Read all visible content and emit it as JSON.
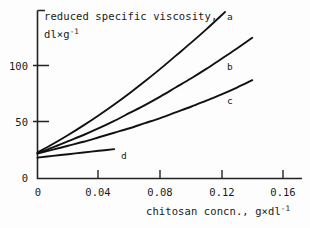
{
  "chart_data": {
    "type": "line",
    "title": "",
    "ylabel": "reduced specific viscosity, dl×g⁻¹",
    "ylabel_line1": "reduced specific viscosity,",
    "ylabel_line2_base": "dl×g",
    "ylabel_line2_sup": "-1",
    "xlabel": "chitosan concn., g×dl⁻¹",
    "xlabel_base1": "chitosan concn., g×dl",
    "xlabel_sup": "-1",
    "xlim": [
      0,
      0.168
    ],
    "ylim": [
      0,
      128
    ],
    "grid": false,
    "legend_position": "inline-right-of-curve",
    "xticks": [
      0,
      0.04,
      0.08,
      0.12,
      0.16
    ],
    "xtick_labels": [
      "0",
      "0.04",
      "0.08",
      "0.12",
      "0.16"
    ],
    "yticks": [
      0,
      50,
      100
    ],
    "ytick_labels": [
      "0",
      "50",
      "100"
    ],
    "series": [
      {
        "name": "a",
        "label": "a",
        "x": [
          0.0,
          0.01,
          0.02,
          0.03,
          0.04,
          0.05,
          0.06,
          0.07,
          0.08,
          0.09,
          0.1,
          0.11,
          0.12,
          0.13,
          0.138
        ],
        "y": [
          23.0,
          30.5,
          38.5,
          47.0,
          56.0,
          65.5,
          75.5,
          86.0,
          97.0,
          108.5,
          120.0,
          132.0,
          144.5,
          157.5,
          168.0
        ]
      },
      {
        "name": "b",
        "label": "b",
        "x": [
          0.0,
          0.01,
          0.02,
          0.03,
          0.04,
          0.05,
          0.06,
          0.07,
          0.08,
          0.09,
          0.1,
          0.11,
          0.12,
          0.13,
          0.14
        ],
        "y": [
          22.5,
          27.5,
          33.0,
          38.5,
          44.5,
          51.0,
          58.0,
          65.0,
          72.5,
          80.5,
          88.5,
          97.0,
          106.0,
          115.0,
          124.5
        ]
      },
      {
        "name": "c",
        "label": "c",
        "x": [
          0.0,
          0.01,
          0.02,
          0.03,
          0.04,
          0.05,
          0.06,
          0.07,
          0.08,
          0.09,
          0.1,
          0.11,
          0.12,
          0.13,
          0.14
        ],
        "y": [
          22.0,
          25.5,
          29.0,
          32.5,
          36.5,
          40.5,
          44.5,
          49.0,
          53.5,
          58.5,
          63.5,
          69.0,
          74.5,
          80.5,
          87.0
        ]
      },
      {
        "name": "d",
        "label": "d",
        "x": [
          0.0,
          0.01,
          0.02,
          0.03,
          0.04,
          0.05
        ],
        "y": [
          18.5,
          20.0,
          21.5,
          23.0,
          24.5,
          26.0
        ]
      }
    ]
  },
  "axes": {
    "ylabel_line1": "reduced specific viscosity,",
    "ylabel_line2_base": "dl×g",
    "ylabel_line2_sup": "-1",
    "xlabel_base": "chitosan concn., g×dl",
    "xlabel_sup": "-1",
    "xtick_labels": [
      "0",
      "0.04",
      "0.08",
      "0.12",
      "0.16"
    ],
    "ytick_labels": [
      "100",
      "50",
      "0"
    ]
  },
  "curve_labels": {
    "a": "a",
    "b": "b",
    "c": "c",
    "d": "d"
  },
  "colors": {
    "line": "#111111",
    "axis": "#222222",
    "background": "#fdfdfd",
    "text": "#1a1a1a"
  }
}
